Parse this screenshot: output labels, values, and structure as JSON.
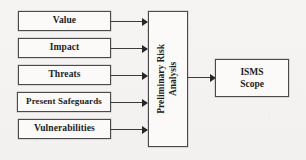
{
  "diagram": {
    "type": "flowchart",
    "background_color": "#f4f3f1",
    "border_color": "#4a4a4a",
    "arrow_color": "#262626",
    "inputs": [
      {
        "label": "Value"
      },
      {
        "label": "Impact"
      },
      {
        "label": "Threats"
      },
      {
        "label": "Present Safeguards"
      },
      {
        "label": "Vulnerabilities"
      }
    ],
    "process": {
      "line1": "Preliminary Risk",
      "line2": "Analysis"
    },
    "output": {
      "line1": "ISMS",
      "line2": "Scope"
    }
  }
}
